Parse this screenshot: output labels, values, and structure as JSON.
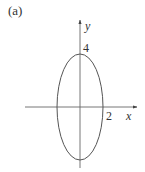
{
  "figure": {
    "panel_label": "(a)",
    "axes": {
      "x_label": "x",
      "y_label": "y"
    },
    "ticks": {
      "x_intercept_label": "2",
      "y_intercept_label": "4"
    },
    "curve": {
      "type": "ellipse",
      "center": [
        0,
        0
      ],
      "semi_axis_x": 2,
      "semi_axis_y": 4
    },
    "colors": {
      "line": "#555555",
      "text": "#333333",
      "background": "#ffffff"
    }
  }
}
